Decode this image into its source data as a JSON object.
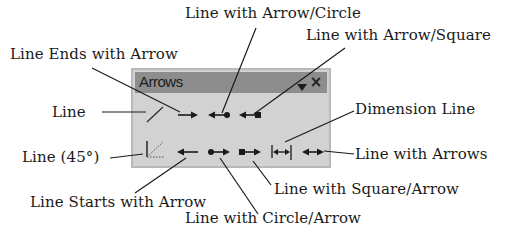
{
  "panel": {
    "title": "Arrows",
    "menu_icon": "dropdown-triangle-icon",
    "close_label": "×",
    "colors": {
      "panel_bg": "#d2d2d2",
      "titlebar_bg": "#8d8d8d",
      "border": "#b9b9b9"
    },
    "rows": [
      [
        {
          "id": "line",
          "name": "Line"
        },
        {
          "id": "line-ends-with-arrow",
          "name": "Line Ends with Arrow"
        },
        {
          "id": "line-with-arrow-circle",
          "name": "Line with Arrow/Circle"
        },
        {
          "id": "line-with-arrow-square",
          "name": "Line with Arrow/Square"
        }
      ],
      [
        {
          "id": "line-45",
          "name": "Line (45°)"
        },
        {
          "id": "line-starts-with-arrow",
          "name": "Line Starts with Arrow"
        },
        {
          "id": "line-with-circle-arrow",
          "name": "Line with Circle/Arrow"
        },
        {
          "id": "line-with-square-arrow",
          "name": "Line with Square/Arrow"
        },
        {
          "id": "dimension-line",
          "name": "Dimension Line"
        },
        {
          "id": "line-with-arrows",
          "name": "Line with Arrows"
        }
      ]
    ]
  },
  "callouts": {
    "line_with_arrow_circle": "Line with Arrow/Circle",
    "line_ends_with_arrow": "Line Ends with Arrow",
    "line_with_arrow_square": "Line with Arrow/Square",
    "line": "Line",
    "dimension_line": "Dimension Line",
    "line_45": "Line (45°)",
    "line_with_arrows": "Line with Arrows",
    "line_with_square_arrow": "Line with Square/Arrow",
    "line_starts_with_arrow": "Line Starts with Arrow",
    "line_with_circle_arrow": "Line with Circle/Arrow"
  }
}
